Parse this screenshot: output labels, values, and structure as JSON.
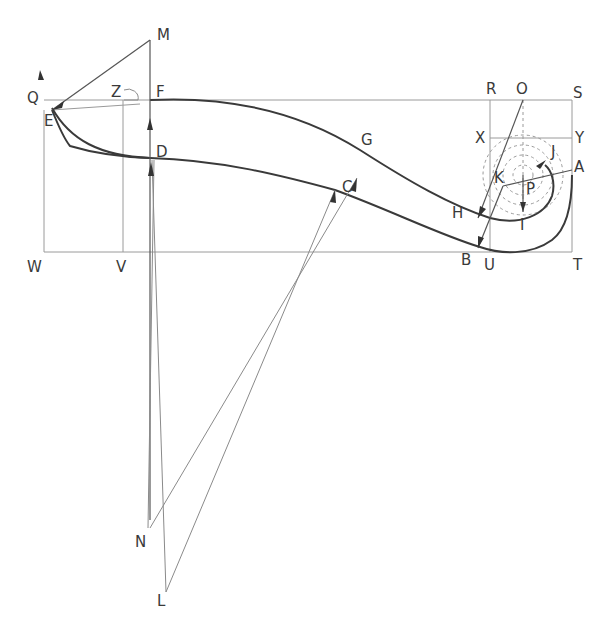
{
  "labels": {
    "M": "M",
    "F": "F",
    "Z": "Z",
    "Q": "Q",
    "E": "E",
    "D": "D",
    "W": "W",
    "V": "V",
    "G": "G",
    "C": "C",
    "R": "R",
    "O": "O",
    "S": "S",
    "X": "X",
    "Y": "Y",
    "J": "J",
    "A": "A",
    "K": "K",
    "P": "P",
    "H": "H",
    "I": "I",
    "B": "B",
    "U": "U",
    "T": "T",
    "N": "N",
    "L": "L"
  }
}
